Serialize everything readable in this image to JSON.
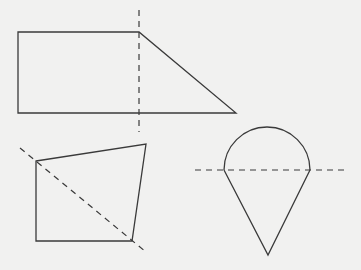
{
  "diagram": {
    "colors": {
      "background": "#f1f1f0",
      "stroke": "#3a3a3a"
    },
    "figures": [
      {
        "name": "right-trapezoid",
        "points": "18,32 139,32 236,113 18,113",
        "dashed_line": {
          "x1": 139,
          "y1": 10,
          "x2": 139,
          "y2": 132,
          "orientation": "vertical"
        }
      },
      {
        "name": "quadrilateral",
        "points": "36,161 146,144 132,241 36,241",
        "dashed_line": {
          "x1": 20,
          "y1": 148,
          "x2": 146,
          "y2": 252,
          "orientation": "diagonal"
        }
      },
      {
        "name": "semicircle-on-triangle",
        "arc_path": "M 224 170 A 43 43 0 0 1 310 170",
        "triangle_points": "224,170 268,255 310,170",
        "dashed_line": {
          "x1": 195,
          "y1": 170,
          "x2": 344,
          "y2": 170,
          "orientation": "horizontal"
        }
      }
    ]
  }
}
